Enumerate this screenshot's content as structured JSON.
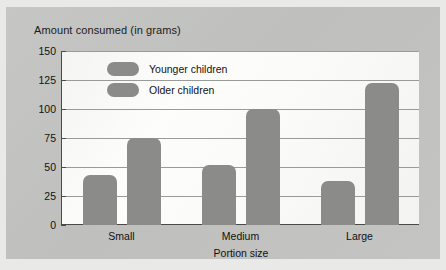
{
  "chart_data": {
    "type": "bar",
    "title": "Amount consumed (in grams)",
    "xlabel": "Portion size",
    "ylabel": "Amount consumed (in grams)",
    "categories": [
      "Small",
      "Medium",
      "Large"
    ],
    "series": [
      {
        "name": "Younger children",
        "values": [
          43,
          52,
          38
        ],
        "color": "#8b8b89"
      },
      {
        "name": "Older children",
        "values": [
          75,
          100,
          122
        ],
        "color": "#8b8b89"
      }
    ],
    "ylim": [
      0,
      150
    ],
    "yticks": [
      0,
      25,
      50,
      75,
      100,
      125,
      150
    ],
    "ytick_labels": [
      "0",
      "25",
      "50",
      "75",
      "100",
      "125",
      "150"
    ],
    "grid": true,
    "legend_position": "upper-left-inside",
    "plot_background": "#fbfbfa",
    "panel_background": "#c2c2c0"
  },
  "legend": {
    "items": [
      {
        "label": "Younger children"
      },
      {
        "label": "Older children"
      }
    ]
  },
  "axes": {
    "y_title": "Amount consumed (in grams)",
    "x_title": "Portion size"
  }
}
